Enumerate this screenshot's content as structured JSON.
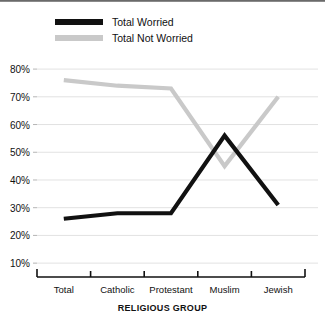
{
  "chart_data": {
    "type": "line",
    "title": "",
    "xlabel": "RELIGIOUS GROUP",
    "ylabel": "",
    "categories": [
      "Total",
      "Catholic",
      "Protestant",
      "Muslim",
      "Jewish"
    ],
    "series": [
      {
        "name": "Total Worried",
        "color": "#111111",
        "values": [
          26,
          28,
          28,
          56,
          31
        ]
      },
      {
        "name": "Total Not Worried",
        "color": "#c9c9c9",
        "values": [
          76,
          74,
          73,
          45,
          70
        ]
      }
    ],
    "ylim": [
      5,
      84
    ],
    "yticks": [
      10,
      20,
      30,
      40,
      50,
      60,
      70,
      80
    ],
    "ytick_labels": [
      "10%",
      "20%",
      "30%",
      "40%",
      "50%",
      "60%",
      "70%",
      "80%"
    ],
    "grid": true,
    "grid_color": "#e2e2e2",
    "legend_position": "top-left",
    "axis_color": "#111111"
  },
  "legend": {
    "items": [
      {
        "label": "Total Worried",
        "swatch": "#111111"
      },
      {
        "label": "Total Not Worried",
        "swatch": "#c9c9c9"
      }
    ]
  },
  "axis": {
    "x_title": "RELIGIOUS GROUP"
  }
}
